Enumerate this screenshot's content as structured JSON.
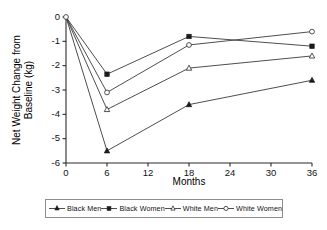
{
  "chart_data": {
    "type": "line",
    "title": "",
    "xlabel": "Months",
    "ylabel": "Net Weight Change from Baseline (kg)",
    "ylabel_line1": "Net Weight Change from",
    "ylabel_line2": "Baseline (kg)",
    "x": [
      0,
      6,
      18,
      36
    ],
    "xlim": [
      0,
      36
    ],
    "ylim": [
      -6,
      0
    ],
    "xticks": [
      0,
      6,
      12,
      18,
      24,
      30,
      36
    ],
    "xtick_labels": [
      "0",
      "6",
      "12",
      "18",
      "24",
      "30",
      "36"
    ],
    "yticks": [
      0,
      -1,
      -2,
      -3,
      -4,
      -5,
      -6
    ],
    "ytick_labels": [
      "0",
      "-1",
      "-2",
      "-3",
      "-4",
      "-5",
      "-6"
    ],
    "grid": false,
    "legend_position": "bottom",
    "series": [
      {
        "name": "Black Men",
        "marker": "triangle-filled",
        "filled": true,
        "values": [
          0,
          -5.5,
          -3.6,
          -2.6
        ]
      },
      {
        "name": "Black Women",
        "marker": "square-filled",
        "filled": true,
        "values": [
          0,
          -2.35,
          -0.8,
          -1.2
        ]
      },
      {
        "name": "White Men",
        "marker": "triangle-open",
        "filled": false,
        "values": [
          0,
          -3.8,
          -2.1,
          -1.6
        ]
      },
      {
        "name": "White Women",
        "marker": "circle-open",
        "filled": false,
        "values": [
          0,
          -3.1,
          -1.15,
          -0.6
        ]
      }
    ]
  },
  "legend": {
    "items": [
      {
        "label": "Black Men"
      },
      {
        "label": "Black Women"
      },
      {
        "label": "White Men"
      },
      {
        "label": "White Women"
      }
    ]
  },
  "colors": {
    "axis": "#2b2b2b",
    "line": "#3a3a3a",
    "marker_fill": "#1b1b1b",
    "marker_open": "#ffffff",
    "background": "#ffffff"
  }
}
